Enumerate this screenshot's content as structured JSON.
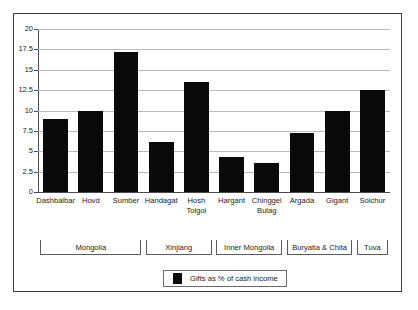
{
  "chart_data": {
    "type": "bar",
    "title": "",
    "xlabel": "",
    "ylabel": "",
    "ylim": [
      0,
      20
    ],
    "ytick_values": [
      20,
      17.5,
      15,
      12.5,
      10,
      7.5,
      5,
      2.5,
      0
    ],
    "ytick_labels": [
      "20",
      "17.5",
      "15",
      "12.5",
      "10",
      "7.5",
      "5",
      "2.5",
      "0"
    ],
    "grid": true,
    "legend_position": "bottom-center",
    "bar_color": "#0a0a0c",
    "gridline_color": "#b9b9bd",
    "axis_color": "#4a4a50",
    "categories": [
      "Dashbalbar",
      "Hovd",
      "Sumber",
      "Handagat",
      "Hosh Tolgoi",
      "Hargant",
      "Chinggel Bulag",
      "Argada",
      "Gigant",
      "Solchur"
    ],
    "category_label_lines": [
      [
        "Dashbalbar"
      ],
      [
        "Hovd"
      ],
      [
        "Sumber"
      ],
      [
        "Handagat"
      ],
      [
        "Hosh",
        "Tolgoi"
      ],
      [
        "Hargant"
      ],
      [
        "Chinggel",
        "Bulag"
      ],
      [
        "Argada"
      ],
      [
        "Gigant"
      ],
      [
        "Solchur"
      ]
    ],
    "series": [
      {
        "name": "Gifts as % of cash income",
        "values": [
          9.0,
          9.9,
          17.2,
          6.1,
          13.5,
          4.35,
          3.5,
          7.3,
          9.9,
          12.5
        ]
      }
    ],
    "groups": [
      {
        "label": "Mongolia",
        "start_index": 0,
        "end_index": 2
      },
      {
        "label": "Xinjiang",
        "start_index": 3,
        "end_index": 4
      },
      {
        "label": "Inner Mongolia",
        "start_index": 5,
        "end_index": 6
      },
      {
        "label": "Buryatia & Chita",
        "start_index": 7,
        "end_index": 8
      },
      {
        "label": "Tuva",
        "start_index": 9,
        "end_index": 9
      }
    ],
    "legend": [
      {
        "label": "Gifts as % of cash income",
        "color": "#0a0a0c"
      }
    ]
  }
}
